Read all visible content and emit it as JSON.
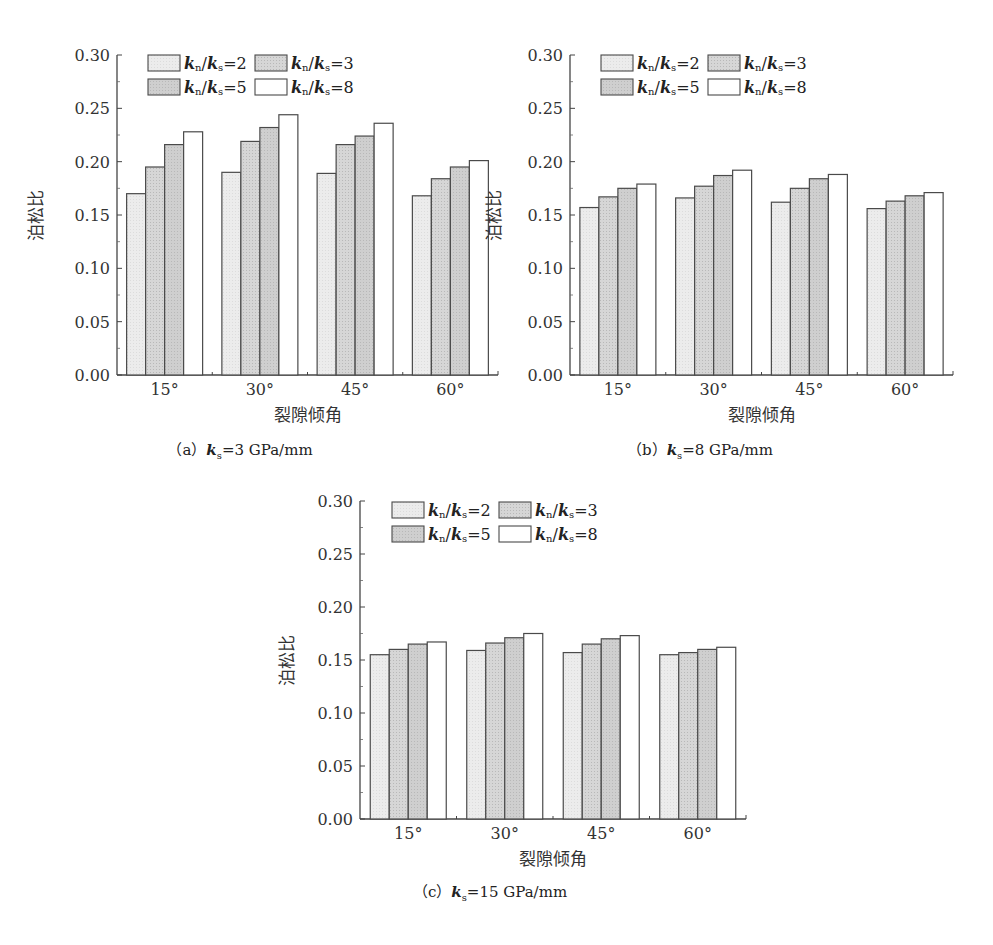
{
  "figure": {
    "y_label": "泊松比",
    "x_label": "裂隙倾角",
    "categories": [
      "15°",
      "30°",
      "45°",
      "60°"
    ],
    "y_ticks": [
      "0.00",
      "0.05",
      "0.10",
      "0.15",
      "0.20",
      "0.25",
      "0.30"
    ],
    "legend": [
      {
        "label": "kn/ks=2",
        "ratio": "2",
        "fill": "#ececec"
      },
      {
        "label": "kn/ks=3",
        "ratio": "3",
        "fill": "#d6d6d6"
      },
      {
        "label": "kn/ks=5",
        "ratio": "5",
        "fill": "#cfcfcf"
      },
      {
        "label": "kn/ks=8",
        "ratio": "8",
        "fill": "#ffffff"
      }
    ],
    "bar_outline": "#4a4a4a"
  },
  "panels": {
    "a": {
      "prefix": "（a）",
      "ks_value": "=3 GPa/mm"
    },
    "b": {
      "prefix": "（b）",
      "ks_value": "=8 GPa/mm"
    },
    "c": {
      "prefix": "（c）",
      "ks_value": "=15 GPa/mm"
    }
  },
  "chart_data": [
    {
      "type": "bar",
      "title": "(a) ks=3 GPa/mm",
      "xlabel": "裂隙倾角",
      "ylabel": "泊松比",
      "categories": [
        "15°",
        "30°",
        "45°",
        "60°"
      ],
      "ylim": [
        0,
        0.3
      ],
      "yticks": [
        0,
        0.05,
        0.1,
        0.15,
        0.2,
        0.25,
        0.3
      ],
      "grid": false,
      "legend_position": "top-left inside",
      "series": [
        {
          "name": "kn/ks=2",
          "values": [
            0.17,
            0.19,
            0.189,
            0.168
          ]
        },
        {
          "name": "kn/ks=3",
          "values": [
            0.195,
            0.219,
            0.216,
            0.184
          ]
        },
        {
          "name": "kn/ks=5",
          "values": [
            0.216,
            0.232,
            0.224,
            0.195
          ]
        },
        {
          "name": "kn/ks=8",
          "values": [
            0.228,
            0.244,
            0.236,
            0.201
          ]
        }
      ]
    },
    {
      "type": "bar",
      "title": "(b) ks=8 GPa/mm",
      "xlabel": "裂隙倾角",
      "ylabel": "泊松比",
      "categories": [
        "15°",
        "30°",
        "45°",
        "60°"
      ],
      "ylim": [
        0,
        0.3
      ],
      "yticks": [
        0,
        0.05,
        0.1,
        0.15,
        0.2,
        0.25,
        0.3
      ],
      "grid": false,
      "legend_position": "top-left inside",
      "series": [
        {
          "name": "kn/ks=2",
          "values": [
            0.157,
            0.166,
            0.162,
            0.156
          ]
        },
        {
          "name": "kn/ks=3",
          "values": [
            0.167,
            0.177,
            0.175,
            0.163
          ]
        },
        {
          "name": "kn/ks=5",
          "values": [
            0.175,
            0.187,
            0.184,
            0.168
          ]
        },
        {
          "name": "kn/ks=8",
          "values": [
            0.179,
            0.192,
            0.188,
            0.171
          ]
        }
      ]
    },
    {
      "type": "bar",
      "title": "(c) ks=15 GPa/mm",
      "xlabel": "裂隙倾角",
      "ylabel": "泊松比",
      "categories": [
        "15°",
        "30°",
        "45°",
        "60°"
      ],
      "ylim": [
        0,
        0.3
      ],
      "yticks": [
        0,
        0.05,
        0.1,
        0.15,
        0.2,
        0.25,
        0.3
      ],
      "grid": false,
      "legend_position": "top-left inside",
      "series": [
        {
          "name": "kn/ks=2",
          "values": [
            0.155,
            0.159,
            0.157,
            0.155
          ]
        },
        {
          "name": "kn/ks=3",
          "values": [
            0.16,
            0.166,
            0.165,
            0.157
          ]
        },
        {
          "name": "kn/ks=5",
          "values": [
            0.165,
            0.171,
            0.17,
            0.16
          ]
        },
        {
          "name": "kn/ks=8",
          "values": [
            0.167,
            0.175,
            0.173,
            0.162
          ]
        }
      ]
    }
  ]
}
